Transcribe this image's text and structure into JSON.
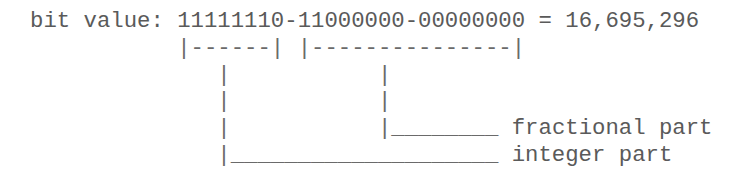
{
  "diagram": {
    "label": "bit value:",
    "bits": {
      "byte1": "11111110",
      "separator1": "-",
      "byte2": "11000000",
      "separator2": "-",
      "byte3": "00000000"
    },
    "equals": "=",
    "decimal_value": "16,695,296",
    "brackets": {
      "integer_bracket": "|------|",
      "fractional_bracket": "|---------------|"
    },
    "connectors": {
      "integer_pipe": "|",
      "fractional_pipe": "|",
      "fractional_leader": "|________",
      "integer_leader": "|____________________"
    },
    "annotations": {
      "fractional": "fractional part",
      "integer": "integer part"
    }
  }
}
